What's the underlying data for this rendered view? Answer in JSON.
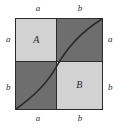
{
  "figure": {
    "square": {
      "border_color": "#2b2b2b",
      "divider_color": "#2b2b2b"
    },
    "regions": {
      "top_left": {
        "label": "A",
        "fill": "#d2d2d2",
        "width_label": "a",
        "height_label": "a"
      },
      "top_right": {
        "label": "",
        "fill": "#6e6e6e",
        "width_label": "b",
        "height_label": "a"
      },
      "bottom_left": {
        "label": "",
        "fill": "#6e6e6e",
        "width_label": "a",
        "height_label": "b"
      },
      "bottom_right": {
        "label": "B",
        "fill": "#d2d2d2",
        "width_label": "b",
        "height_label": "b"
      }
    },
    "edge_labels": {
      "top_left": "a",
      "top_right": "b",
      "bottom_left": "a",
      "bottom_right": "b",
      "left_top": "a",
      "left_bottom": "b",
      "right_top": "a",
      "right_bottom": "b"
    },
    "curve": {
      "color": "#2b2b2b",
      "description": "increasing concave-up curve from bottom-left corner through the interior division point to the top-right corner"
    }
  }
}
